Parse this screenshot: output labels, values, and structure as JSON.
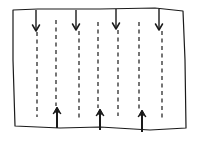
{
  "diagram": {
    "type": "flow-lines-sketch",
    "stroke_color": "#1a1a1a",
    "background": "#ffffff",
    "frame": {
      "shape": "hand-drawn rectangle",
      "points": [
        [
          13,
          10
        ],
        [
          38,
          9
        ],
        [
          100,
          9
        ],
        [
          155,
          8
        ],
        [
          183,
          11
        ],
        [
          185,
          60
        ],
        [
          186,
          128
        ],
        [
          150,
          130
        ],
        [
          100,
          127
        ],
        [
          60,
          128
        ],
        [
          15,
          126
        ],
        [
          13,
          60
        ]
      ]
    },
    "down_arrows": [
      {
        "x": 36,
        "y1": 10,
        "y2": 31
      },
      {
        "x": 76,
        "y1": 10,
        "y2": 30
      },
      {
        "x": 116,
        "y1": 9,
        "y2": 29
      },
      {
        "x": 159,
        "y1": 9,
        "y2": 30
      }
    ],
    "down_dashed": [
      {
        "x": 37,
        "y1": 32,
        "y2": 117
      },
      {
        "x": 79,
        "y1": 31,
        "y2": 118
      },
      {
        "x": 118,
        "y1": 30,
        "y2": 116
      },
      {
        "x": 162,
        "y1": 31,
        "y2": 120
      }
    ],
    "up_arrows": [
      {
        "x": 57,
        "y1": 128,
        "y2": 108
      },
      {
        "x": 100,
        "y1": 130,
        "y2": 110
      },
      {
        "x": 142,
        "y1": 132,
        "y2": 111
      }
    ],
    "up_dashed": [
      {
        "x": 56,
        "y1": 20,
        "y2": 106
      },
      {
        "x": 98,
        "y1": 22,
        "y2": 108
      },
      {
        "x": 139,
        "y1": 22,
        "y2": 110
      }
    ]
  }
}
